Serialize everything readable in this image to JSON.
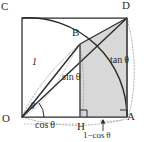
{
  "figure": {
    "kind": "geometry-diagram",
    "colors": {
      "stroke": "#2b2b2b",
      "light_stroke": "#9a9a9a",
      "shade_fill": "#d6d6d6",
      "background": "#ffffff"
    },
    "points": {
      "O": "O",
      "A": "A",
      "B": "B",
      "C": "C",
      "D": "D",
      "H": "H"
    },
    "labels": {
      "radius": "1",
      "angle": "θ",
      "cos": "cos θ",
      "sin": "sin θ",
      "tan": "tan θ",
      "one_minus_cos": "1−cos θ"
    },
    "elements": {
      "square_OADC": "square-O-A-D-C",
      "arc_unit": "arc-C-B-A",
      "arc_outer": "arc-O-A-D",
      "shaded_region": "region-B-H-A-D",
      "right_angle_H": "right-angle-marker-H",
      "right_angle_A": "right-angle-marker-A",
      "segment_OB": "segment-O-B",
      "segment_OD": "segment-O-D",
      "segment_BD": "segment-B-D",
      "segment_BH": "segment-B-H",
      "segment_AD": "segment-A-D",
      "arrow_one_minus_cos": "arrow-H-A-extent"
    }
  }
}
